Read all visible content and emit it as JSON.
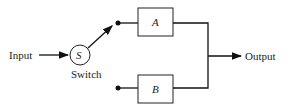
{
  "diagram": {
    "input_label": "Input",
    "switch_symbol": "S",
    "switch_label": "Switch",
    "block_a": "A",
    "block_b": "B",
    "output_label": "Output",
    "line_color": "#111111"
  }
}
